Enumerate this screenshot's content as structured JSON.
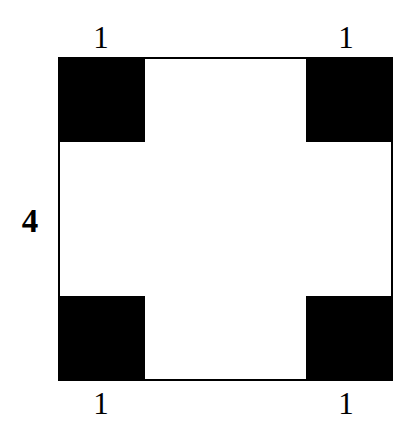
{
  "figure": {
    "type": "geometry-diagram",
    "background_color": "#ffffff",
    "stroke_color": "#000000",
    "fill_color": "#000000"
  },
  "shapes": {
    "outer_square": {
      "name": "outer-square",
      "side_length_label": "4",
      "stroke_width_px": 2.5
    },
    "corners": [
      {
        "name": "top-left-corner-square",
        "side_length_label": "1"
      },
      {
        "name": "top-right-corner-square",
        "side_length_label": "1"
      },
      {
        "name": "bottom-left-corner-square",
        "side_length_label": "1"
      },
      {
        "name": "bottom-right-corner-square",
        "side_length_label": "1"
      }
    ]
  },
  "labels": {
    "top_left": "1",
    "top_right": "1",
    "bottom_left": "1",
    "bottom_right": "1",
    "left_side": "4"
  },
  "chart_data": {
    "type": "diagram",
    "title": "",
    "annotations": [
      "1",
      "1",
      "4",
      "1",
      "1"
    ],
    "values": {
      "outer_side": 4,
      "corner_side": 1,
      "corner_count": 4
    }
  }
}
